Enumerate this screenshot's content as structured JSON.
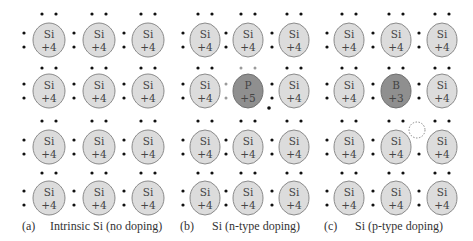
{
  "colors": {
    "si_fill": "#dcdcdc",
    "si_stroke": "#8a8a8a",
    "dopant_fill": "#8f8f8f",
    "dopant_stroke": "#707070",
    "electron": "#111111",
    "donor_electron": "#9a9a9a",
    "hole_stroke": "#888888"
  },
  "panels": [
    {
      "id": "a",
      "tag": "(a)",
      "caption": "Intrinsic Si (no doping)",
      "dopant": null
    },
    {
      "id": "b",
      "tag": "(b)",
      "caption": "Si (n-type doping)",
      "dopant": {
        "symbol": "P",
        "charge": "+5",
        "row": 1,
        "col": 1,
        "feature": "extra free electron"
      }
    },
    {
      "id": "c",
      "tag": "(c)",
      "caption": "Si (p-type doping)",
      "dopant": {
        "symbol": "B",
        "charge": "+3",
        "row": 1,
        "col": 1,
        "feature": "hole (missing electron)"
      }
    }
  ],
  "atom_default": {
    "symbol": "Si",
    "charge": "+4"
  },
  "grid": {
    "rows": 4,
    "cols": 3
  }
}
